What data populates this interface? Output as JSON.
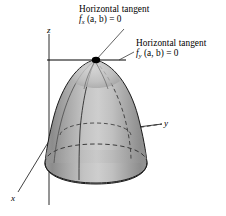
{
  "figure": {
    "type": "3d-surface-diagram",
    "background_color": "#ffffff",
    "ink_color": "#000000"
  },
  "annotations": {
    "fx": {
      "title": "Horizontal tangent",
      "equation_prefix": "f",
      "equation_subscript": "x",
      "equation_rest": " (a, b) = 0",
      "equation_plain": "f_x (a, b) = 0"
    },
    "fy": {
      "title": "Horizontal tangent",
      "equation_prefix": "f",
      "equation_subscript": "y",
      "equation_rest": " (a, b) = 0",
      "equation_plain": "f_y (a, b) = 0"
    }
  },
  "axes": {
    "z": "z",
    "y": "y",
    "x": "x"
  },
  "surface": {
    "fill_light": "#d2d2d2",
    "fill_mid": "#a8a8a8",
    "fill_dark": "#7e7e7e",
    "outline_color": "#1a1a1a",
    "vertex_marker_color": "#000000"
  }
}
